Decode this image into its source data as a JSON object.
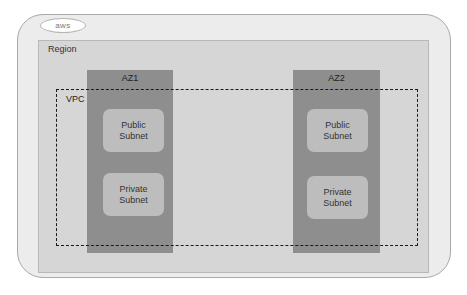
{
  "diagram": {
    "cloud_badge": "aws",
    "region_label": "Region",
    "vpc_label": "VPC",
    "availability_zones": [
      {
        "label": "AZ1",
        "subnets": [
          {
            "line1": "Public",
            "line2": "Subnet"
          },
          {
            "line1": "Private",
            "line2": "Subnet"
          }
        ]
      },
      {
        "label": "AZ2",
        "subnets": [
          {
            "line1": "Public",
            "line2": "Subnet"
          },
          {
            "line1": "Private",
            "line2": "Subnet"
          }
        ]
      }
    ]
  },
  "colors": {
    "outer_frame": "#ececec",
    "region_fill": "#d6d6d6",
    "az_fill": "#8e8e8e",
    "subnet_fill": "#bdbdbd",
    "vpc_border": "#1a1a1a"
  }
}
